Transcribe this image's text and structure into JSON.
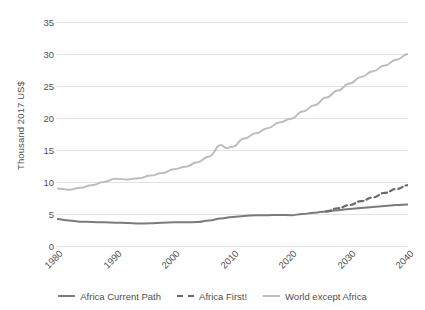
{
  "chart_data": {
    "type": "line",
    "title": "",
    "xlabel": "",
    "ylabel": "Thousand 2017 US$",
    "xlim": [
      1980,
      2040
    ],
    "ylim": [
      0,
      35
    ],
    "ytick_values": [
      0,
      5,
      10,
      15,
      20,
      25,
      30,
      35
    ],
    "ytick_labels": [
      "0",
      "5",
      "10",
      "15",
      "20",
      "25",
      "30",
      "35"
    ],
    "xtick_values": [
      1980,
      1990,
      2000,
      2010,
      2020,
      2030,
      2040
    ],
    "xtick_labels": [
      "1980",
      "1990",
      "2000",
      "2010",
      "2020",
      "2030",
      "2040"
    ],
    "grid": "horizontal",
    "legend_position": "bottom",
    "series": [
      {
        "name": "Africa Current Path",
        "color": "#7b7b7b",
        "style": "solid",
        "x": [
          1980,
          1982,
          1984,
          1986,
          1988,
          1990,
          1992,
          1994,
          1996,
          1998,
          2000,
          2002,
          2004,
          2006,
          2008,
          2010,
          2012,
          2014,
          2016,
          2018,
          2020,
          2022,
          2024,
          2026,
          2028,
          2030,
          2032,
          2034,
          2036,
          2038,
          2040
        ],
        "values": [
          4.2,
          4.0,
          3.8,
          3.75,
          3.7,
          3.65,
          3.6,
          3.5,
          3.55,
          3.65,
          3.7,
          3.7,
          3.75,
          4.0,
          4.3,
          4.55,
          4.7,
          4.8,
          4.8,
          4.85,
          4.8,
          5.0,
          5.2,
          5.4,
          5.6,
          5.8,
          5.95,
          6.1,
          6.25,
          6.4,
          6.5
        ]
      },
      {
        "name": "Africa First!",
        "color": "#6b6b6b",
        "style": "dashed",
        "x": [
          2026,
          2028,
          2030,
          2032,
          2034,
          2036,
          2038,
          2040
        ],
        "values": [
          5.4,
          5.9,
          6.4,
          7.0,
          7.6,
          8.3,
          8.9,
          9.5
        ]
      },
      {
        "name": "World except Africa",
        "color": "#bdbdbd",
        "style": "solid",
        "x": [
          1980,
          1982,
          1984,
          1986,
          1988,
          1990,
          1992,
          1994,
          1996,
          1998,
          2000,
          2002,
          2004,
          2006,
          2008,
          2009,
          2010,
          2012,
          2014,
          2016,
          2018,
          2020,
          2022,
          2024,
          2026,
          2028,
          2030,
          2032,
          2034,
          2036,
          2038,
          2040
        ],
        "values": [
          9.0,
          8.8,
          9.1,
          9.5,
          10.0,
          10.5,
          10.4,
          10.6,
          11.0,
          11.4,
          12.0,
          12.4,
          13.1,
          14.0,
          15.8,
          15.3,
          15.5,
          16.8,
          17.6,
          18.4,
          19.3,
          19.9,
          21.0,
          22.0,
          23.2,
          24.3,
          25.4,
          26.4,
          27.3,
          28.2,
          29.1,
          30.0
        ]
      }
    ]
  },
  "legend": {
    "items": [
      {
        "label": "Africa Current Path"
      },
      {
        "label": "Africa First!"
      },
      {
        "label": "World except Africa"
      }
    ]
  }
}
